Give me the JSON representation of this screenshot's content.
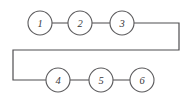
{
  "diagram": {
    "type": "node-link-diagram",
    "canvas": {
      "width": 192,
      "height": 103,
      "background": "#ffffff"
    },
    "style": {
      "stroke_color": "#59585a",
      "node_fill": "#ffffff",
      "node_stroke": "#5c5b5d",
      "label_color": "#3a393b",
      "stroke_width": 1.1,
      "node_radius": 12
    },
    "nodes": [
      {
        "id": "node-1",
        "label": "1",
        "cx": 40,
        "cy": 23,
        "r": 12,
        "row": "top"
      },
      {
        "id": "node-2",
        "label": "2",
        "cx": 80,
        "cy": 23,
        "r": 12,
        "row": "top"
      },
      {
        "id": "node-3",
        "label": "3",
        "cx": 122,
        "cy": 23,
        "r": 12,
        "row": "top"
      },
      {
        "id": "node-4",
        "label": "4",
        "cx": 58,
        "cy": 80,
        "r": 12,
        "row": "bottom"
      },
      {
        "id": "node-5",
        "label": "5",
        "cx": 101,
        "cy": 80,
        "r": 12,
        "row": "bottom"
      },
      {
        "id": "node-6",
        "label": "6",
        "cx": 142,
        "cy": 80,
        "r": 12,
        "row": "bottom"
      }
    ],
    "edges": [
      {
        "id": "edge-1-2",
        "from": "1",
        "to": "2",
        "kind": "straight",
        "d": "M 52 23 L 68 23"
      },
      {
        "id": "edge-2-3",
        "from": "2",
        "to": "3",
        "kind": "straight",
        "d": "M 92 23 L 110 23"
      },
      {
        "id": "edge-3-4",
        "from": "3",
        "to": "4",
        "kind": "wrap",
        "d": "M 134 23 L 179 23 L 179 50 L 13 50 L 13 80 L 46 80"
      },
      {
        "id": "edge-4-5",
        "from": "4",
        "to": "5",
        "kind": "straight",
        "d": "M 70 80 L 89 80"
      },
      {
        "id": "edge-5-6",
        "from": "5",
        "to": "6",
        "kind": "straight",
        "d": "M 113 80 L 130 80"
      }
    ]
  }
}
